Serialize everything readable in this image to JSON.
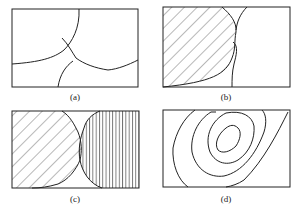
{
  "panels": [
    {
      "id": "a",
      "label": "(a)"
    },
    {
      "id": "b",
      "label": "(b)"
    },
    {
      "id": "c",
      "label": "(c)"
    },
    {
      "id": "d",
      "label": "(d)"
    }
  ]
}
